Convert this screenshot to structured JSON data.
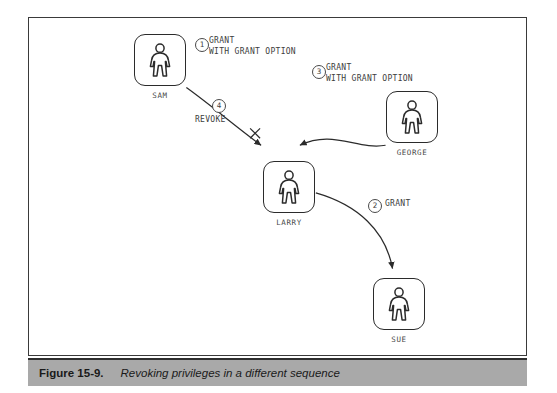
{
  "figure": {
    "caption_label": "Figure 15-9.",
    "caption_text": "Revoking privileges in a different sequence"
  },
  "diagram": {
    "type": "privilege-grant-flow",
    "nodes": [
      {
        "id": "sam",
        "label": "SAM",
        "icon": "person-icon"
      },
      {
        "id": "george",
        "label": "GEORGE",
        "icon": "person-icon"
      },
      {
        "id": "larry",
        "label": "LARRY",
        "icon": "person-icon"
      },
      {
        "id": "sue",
        "label": "SUE",
        "icon": "person-icon"
      }
    ],
    "edges": [
      {
        "id": "sam-to-larry",
        "from": "SAM",
        "to": "LARRY",
        "step": "1",
        "action_line1": "GRANT",
        "action_line2": "WITH GRANT OPTION",
        "revoked": true
      },
      {
        "id": "larry-to-sue",
        "from": "LARRY",
        "to": "SUE",
        "step": "2",
        "action_line1": "GRANT",
        "action_line2": "",
        "revoked": false
      },
      {
        "id": "george-to-larry",
        "from": "GEORGE",
        "to": "LARRY",
        "step": "3",
        "action_line1": "GRANT",
        "action_line2": "WITH GRANT OPTION",
        "revoked": false
      },
      {
        "id": "revoke-sam-larry",
        "from": "SAM",
        "to": "LARRY",
        "step": "4",
        "action_line1": "REVOKE",
        "action_line2": "",
        "revoked": false
      }
    ]
  },
  "colors": {
    "ink": "#2b2b2b",
    "caption_bar": "#a9a9a9",
    "frame": "#3a3a3a"
  }
}
